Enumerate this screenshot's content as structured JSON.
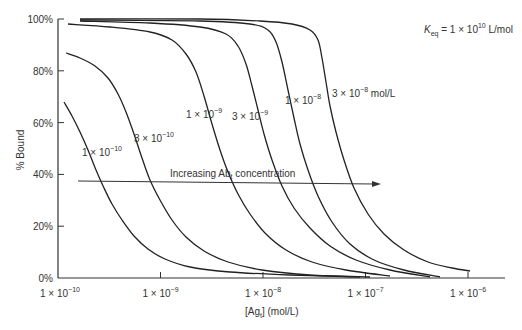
{
  "chart_data": {
    "type": "line",
    "title": "",
    "annotation_keq": {
      "K": "K",
      "sub": "eq",
      "value": " = 1 × 10",
      "exp": "10",
      "unit": " L/mol"
    },
    "xlabel": {
      "pre": "[Ag",
      "sub": "t",
      "post": "] (mol/L)"
    },
    "ylabel": "% Bound",
    "x_scale": "log",
    "xlim": [
      1e-10,
      3e-06
    ],
    "ylim": [
      0,
      100
    ],
    "grid": false,
    "x_ticks": [
      {
        "value": 1e-10,
        "mant": "1 × 10",
        "exp": "−10"
      },
      {
        "value": 1e-09,
        "mant": "1 × 10",
        "exp": "−9"
      },
      {
        "value": 1e-08,
        "mant": "1 × 10",
        "exp": "−8"
      },
      {
        "value": 1e-07,
        "mant": "1 × 10",
        "exp": "−7"
      },
      {
        "value": 1e-06,
        "mant": "1 × 10",
        "exp": "−6"
      }
    ],
    "y_ticks": [
      "0%",
      "20%",
      "40%",
      "60%",
      "80%",
      "100%"
    ],
    "arrow_annotation": {
      "pre": "Increasing Ab",
      "sub": "t",
      "post": " concentration"
    },
    "series": [
      {
        "name": "1 × 10⁻¹⁰",
        "label_mant": "1 × 10",
        "label_exp": "−10",
        "label_px": [
          82,
          156
        ],
        "points_px": [
          [
            64,
            102
          ],
          [
            72,
            116
          ],
          [
            80,
            132
          ],
          [
            88,
            150
          ],
          [
            96,
            170
          ],
          [
            104,
            188
          ],
          [
            112,
            204
          ],
          [
            122,
            220
          ],
          [
            134,
            236
          ],
          [
            148,
            249
          ],
          [
            165,
            259
          ],
          [
            190,
            267
          ],
          [
            230,
            272
          ],
          [
            290,
            275
          ],
          [
            360,
            277
          ]
        ]
      },
      {
        "name": "3 × 10⁻¹⁰",
        "label_mant": "3 × 10",
        "label_exp": "−10",
        "label_px": [
          134,
          142
        ],
        "points_px": [
          [
            66,
            53
          ],
          [
            80,
            58
          ],
          [
            95,
            66
          ],
          [
            108,
            78
          ],
          [
            118,
            94
          ],
          [
            126,
            112
          ],
          [
            134,
            134
          ],
          [
            142,
            158
          ],
          [
            150,
            180
          ],
          [
            160,
            200
          ],
          [
            172,
            220
          ],
          [
            186,
            237
          ],
          [
            204,
            251
          ],
          [
            228,
            262
          ],
          [
            262,
            270
          ],
          [
            310,
            275
          ],
          [
            370,
            277
          ]
        ]
      },
      {
        "name": "1 × 10⁻⁹",
        "label_mant": "1 × 10",
        "label_exp": "−9",
        "label_px": [
          186,
          118
        ],
        "points_px": [
          [
            68,
            24
          ],
          [
            110,
            27
          ],
          [
            150,
            32
          ],
          [
            172,
            40
          ],
          [
            186,
            54
          ],
          [
            196,
            72
          ],
          [
            204,
            96
          ],
          [
            212,
            124
          ],
          [
            220,
            150
          ],
          [
            228,
            172
          ],
          [
            238,
            194
          ],
          [
            250,
            214
          ],
          [
            266,
            234
          ],
          [
            286,
            250
          ],
          [
            312,
            262
          ],
          [
            346,
            270
          ],
          [
            390,
            276
          ]
        ]
      },
      {
        "name": "3 × 10⁻⁹",
        "label_mant": "3 × 10",
        "label_exp": "−9",
        "label_px": [
          232,
          120
        ],
        "points_px": [
          [
            80,
            21
          ],
          [
            150,
            23
          ],
          [
            200,
            27
          ],
          [
            226,
            34
          ],
          [
            238,
            46
          ],
          [
            246,
            64
          ],
          [
            252,
            86
          ],
          [
            258,
            110
          ],
          [
            264,
            134
          ],
          [
            272,
            160
          ],
          [
            282,
            186
          ],
          [
            294,
            208
          ],
          [
            310,
            228
          ],
          [
            330,
            246
          ],
          [
            356,
            260
          ],
          [
            390,
            270
          ],
          [
            430,
            277
          ]
        ]
      },
      {
        "name": "1 × 10⁻⁸",
        "label_mant": "1 × 10",
        "label_exp": "−8",
        "label_px": [
          285,
          104
        ],
        "points_px": [
          [
            80,
            20
          ],
          [
            200,
            21
          ],
          [
            250,
            24
          ],
          [
            268,
            30
          ],
          [
            276,
            42
          ],
          [
            282,
            62
          ],
          [
            288,
            90
          ],
          [
            294,
            118
          ],
          [
            300,
            144
          ],
          [
            308,
            170
          ],
          [
            318,
            196
          ],
          [
            332,
            222
          ],
          [
            350,
            244
          ],
          [
            374,
            260
          ],
          [
            404,
            270
          ],
          [
            440,
            277
          ]
        ]
      },
      {
        "name": "3 × 10⁻⁸ mol/L",
        "label_mant": "3 × 10",
        "label_exp": "−8",
        "label_suffix": " mol/L",
        "label_px": [
          332,
          97
        ],
        "points_px": [
          [
            80,
            19
          ],
          [
            200,
            19
          ],
          [
            260,
            21
          ],
          [
            292,
            24
          ],
          [
            310,
            30
          ],
          [
            318,
            40
          ],
          [
            322,
            58
          ],
          [
            326,
            82
          ],
          [
            330,
            106
          ],
          [
            336,
            132
          ],
          [
            344,
            160
          ],
          [
            354,
            188
          ],
          [
            368,
            214
          ],
          [
            384,
            234
          ],
          [
            404,
            250
          ],
          [
            428,
            262
          ],
          [
            452,
            268
          ],
          [
            470,
            271
          ]
        ]
      }
    ],
    "legend": {
      "position": "inline curve labels"
    }
  }
}
